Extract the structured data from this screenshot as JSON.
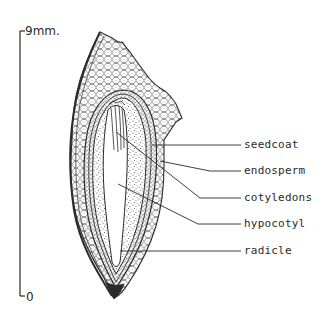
{
  "diagram": {
    "type": "botanical seed cross-section",
    "scale": {
      "top_label": "9mm.",
      "bottom_label": "0"
    },
    "labels": [
      {
        "id": "seedcoat",
        "text": "seedcoat"
      },
      {
        "id": "endosperm",
        "text": "endosperm"
      },
      {
        "id": "cotyledons",
        "text": "cotyledons"
      },
      {
        "id": "hypocotyl",
        "text": "hypocotyl"
      },
      {
        "id": "radicle",
        "text": "radicle"
      }
    ],
    "colors": {
      "ink": "#2a2a2a",
      "background": "#ffffff"
    }
  }
}
